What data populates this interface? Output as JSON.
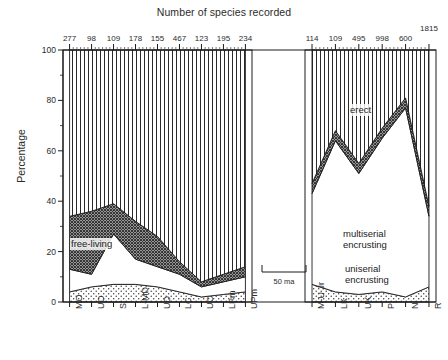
{
  "figure": {
    "title": "Number of species recorded",
    "y_axis_label": "Percentage"
  },
  "scale_bar": {
    "label": "50 ma"
  },
  "annotations": {
    "erect": "erect",
    "multiserial": "multiserial\nencrusting",
    "multiserial_l1": "multiserial",
    "multiserial_l2": "encrusting",
    "uniserial_l1": "uniserial",
    "uniserial_l2": "encrusting",
    "free_living": "free-living"
  },
  "chart_data": {
    "type": "area",
    "title": "Number of species recorded",
    "xlabel": "",
    "ylabel": "Percentage",
    "ylim": [
      0,
      100
    ],
    "xtick_rotation": -90,
    "grid": false,
    "legend_position": "inline-annotations",
    "stacking": "percent",
    "panels": [
      {
        "name": "left-panel",
        "categories": [
          "MO",
          "UO",
          "S",
          "L-MD",
          "UD",
          "LC",
          "UC",
          "LPm",
          "UPm"
        ],
        "species_counts": [
          277,
          98,
          109,
          178,
          155,
          467,
          123,
          195,
          234
        ],
        "series": [
          {
            "name": "uniserial encrusting",
            "pattern": "stipple",
            "values": [
              4,
              6,
              7,
              7,
              6,
              4,
              2,
              3,
              4
            ]
          },
          {
            "name": "free-living",
            "pattern": "white",
            "values": [
              9,
              5,
              20,
              10,
              8,
              7,
              4,
              5,
              6
            ]
          },
          {
            "name": "multiserial encrusting",
            "pattern": "crosshatch",
            "values": [
              21,
              25,
              12,
              15,
              12,
              5,
              2,
              3,
              4
            ]
          },
          {
            "name": "erect",
            "pattern": "vertical-lines",
            "values": [
              66,
              64,
              61,
              68,
              74,
              84,
              92,
              89,
              86
            ]
          }
        ]
      },
      {
        "name": "right-panel",
        "categories": [
          "M-U Jr",
          "LK",
          "UK",
          "P",
          "N",
          "R"
        ],
        "species_counts": [
          114,
          109,
          495,
          998,
          600,
          1815
        ],
        "series": [
          {
            "name": "uniserial encrusting",
            "pattern": "stipple",
            "values": [
              7,
              4,
              3,
              4,
              2,
              6
            ]
          },
          {
            "name": "multiserial encrusting",
            "pattern": "white",
            "values": [
              36,
              60,
              48,
              61,
              75,
              28
            ]
          },
          {
            "name": "erect-boundary-band",
            "pattern": "crosshatch",
            "values": [
              4,
              4,
              4,
              4,
              4,
              4
            ]
          },
          {
            "name": "erect",
            "pattern": "vertical-lines",
            "values": [
              53,
              32,
              45,
              31,
              19,
              62
            ]
          }
        ]
      }
    ],
    "top_axis": {
      "label": "Number of species recorded",
      "left_values": [
        277,
        98,
        109,
        178,
        155,
        467,
        123,
        195,
        234
      ],
      "right_values": [
        114,
        109,
        495,
        998,
        600,
        1815
      ]
    },
    "y_ticks": [
      0,
      20,
      40,
      60,
      80,
      100
    ]
  },
  "colors": {
    "ink": "#1a1a1a",
    "text": "#2b2b2b",
    "background": "#ffffff"
  }
}
